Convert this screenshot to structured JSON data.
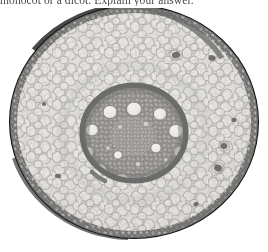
{
  "page": {
    "background_color": "#ffffff",
    "width": 268,
    "height": 252
  },
  "question": {
    "text": "monocot or a dicot. Explain your answer.",
    "clipped": "true"
  },
  "figure": {
    "caption": "",
    "specimen_name": "monocot-root-cross-section",
    "image_type": "light-microscope-photomicrograph",
    "palette": {
      "background": "#ffffff",
      "epidermis_dark": "#1d1c1b",
      "cortex_fill": "#d8d6d2",
      "cortex_wall": "#6f6c68",
      "endodermis_dark": "#141413",
      "stele_fill": "#4c4a47",
      "xylem_vessel": "#f2f1ee",
      "lacuna_dark": "#121110"
    },
    "geometry": {
      "root_center_x": 134,
      "root_center_y": 122,
      "root_radius_x": 124,
      "root_radius_y": 116,
      "stele_center_x": 134,
      "stele_center_y": 133,
      "stele_radius_x": 52,
      "stele_radius_y": 48
    },
    "structures": [
      {
        "name": "epidermis",
        "label": "epidermis",
        "description": "outer beaded ring of small dark cells"
      },
      {
        "name": "cortex",
        "label": "cortex",
        "description": "broad zone of large rounded pale parenchyma cells"
      },
      {
        "name": "endodermis",
        "label": "endodermis",
        "description": "dark thick ring bounding the stele"
      },
      {
        "name": "stele",
        "label": "stele",
        "description": "central vascular cylinder, dark fine-celled"
      },
      {
        "name": "metaxylem-vessels",
        "label": "metaxylem vessels",
        "description": "ring of large white circular vessels",
        "count": 13
      },
      {
        "name": "pith",
        "label": "pith",
        "description": "small-celled centre inside the vessel ring"
      },
      {
        "name": "cortical-lacunae",
        "label": "air spaces",
        "description": "scattered dark cavities in the cortex",
        "count": 6
      }
    ],
    "xylem_vessels": [
      {
        "cx": 134,
        "cy": 101,
        "rx": 7.5,
        "ry": 7.0
      },
      {
        "cx": 110,
        "cy": 104,
        "rx": 7.0,
        "ry": 6.6
      },
      {
        "cx": 160,
        "cy": 106,
        "rx": 6.6,
        "ry": 6.2
      },
      {
        "cx": 92,
        "cy": 122,
        "rx": 6.3,
        "ry": 6.0
      },
      {
        "cx": 176,
        "cy": 123,
        "rx": 7.2,
        "ry": 6.7
      },
      {
        "cx": 88,
        "cy": 144,
        "rx": 6.0,
        "ry": 5.7
      },
      {
        "cx": 180,
        "cy": 144,
        "rx": 6.4,
        "ry": 6.0
      },
      {
        "cx": 100,
        "cy": 162,
        "rx": 6.8,
        "ry": 6.3
      },
      {
        "cx": 170,
        "cy": 162,
        "rx": 6.2,
        "ry": 5.9
      },
      {
        "cx": 122,
        "cy": 172,
        "rx": 7.0,
        "ry": 6.4
      },
      {
        "cx": 148,
        "cy": 173,
        "rx": 6.6,
        "ry": 6.1
      },
      {
        "cx": 156,
        "cy": 140,
        "rx": 5.2,
        "ry": 4.9
      },
      {
        "cx": 118,
        "cy": 146,
        "rx": 4.4,
        "ry": 4.2
      }
    ],
    "lacunae": [
      {
        "cx": 176,
        "cy": 55,
        "rx": 4.2,
        "ry": 3.2,
        "rot": -18
      },
      {
        "cx": 212,
        "cy": 58,
        "rx": 3.6,
        "ry": 2.8,
        "rot": 12
      },
      {
        "cx": 58,
        "cy": 176,
        "rx": 3.0,
        "ry": 2.3,
        "rot": 8
      },
      {
        "cx": 224,
        "cy": 146,
        "rx": 3.4,
        "ry": 3.0,
        "rot": -5
      },
      {
        "cx": 218,
        "cy": 168,
        "rx": 4.0,
        "ry": 3.4,
        "rot": 22
      },
      {
        "cx": 234,
        "cy": 120,
        "rx": 2.6,
        "ry": 2.2,
        "rot": 0
      }
    ]
  }
}
